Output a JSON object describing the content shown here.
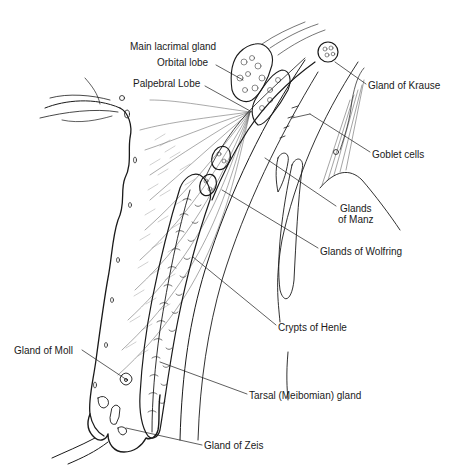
{
  "figure": {
    "colors": {
      "ink": "#1a1a1a",
      "background": "#ffffff"
    }
  },
  "labels": [
    {
      "id": "main-lacrimal-gland",
      "text": "Main lacrimal gland",
      "x": 130,
      "y": 41
    },
    {
      "id": "orbital-lobe",
      "text": "Orbital lobe",
      "x": 157,
      "y": 57
    },
    {
      "id": "palpebral-lobe",
      "text": "Palpebral Lobe",
      "x": 133,
      "y": 78
    },
    {
      "id": "gland-of-krause",
      "text": "Gland of Krause",
      "x": 368,
      "y": 80
    },
    {
      "id": "goblet-cells",
      "text": "Goblet cells",
      "x": 372,
      "y": 149
    },
    {
      "id": "glands-of-manz",
      "text": "Glands\nof Manz",
      "x": 338,
      "y": 203
    },
    {
      "id": "glands-of-wolfring",
      "text": "Glands of Wolfring",
      "x": 320,
      "y": 246
    },
    {
      "id": "crypts-of-henle",
      "text": "Crypts of Henle",
      "x": 278,
      "y": 322
    },
    {
      "id": "gland-of-moll",
      "text": "Gland of Moll",
      "x": 14,
      "y": 345
    },
    {
      "id": "tarsal-gland",
      "text": "Tarsal (Meibomian) gland",
      "x": 249,
      "y": 390
    },
    {
      "id": "gland-of-zeis",
      "text": "Gland of Zeis",
      "x": 204,
      "y": 440
    }
  ],
  "leader_lines": [
    {
      "for": "orbital-lobe",
      "x1": 216,
      "y1": 65,
      "x2": 243,
      "y2": 80
    },
    {
      "for": "palpebral-lobe",
      "x1": 205,
      "y1": 86,
      "x2": 252,
      "y2": 112
    },
    {
      "for": "gland-of-krause",
      "x1": 366,
      "y1": 84,
      "x2": 335,
      "y2": 62
    },
    {
      "for": "goblet-cells",
      "x1": 370,
      "y1": 152,
      "x2": 310,
      "y2": 114
    },
    {
      "for": "goblet-cells-2",
      "x1": 310,
      "y1": 114,
      "x2": 292,
      "y2": 118
    },
    {
      "for": "glands-of-manz",
      "x1": 336,
      "y1": 206,
      "x2": 265,
      "y2": 158
    },
    {
      "for": "glands-of-wolfring",
      "x1": 318,
      "y1": 248,
      "x2": 222,
      "y2": 190
    },
    {
      "for": "crypts-of-henle",
      "x1": 276,
      "y1": 325,
      "x2": 193,
      "y2": 257
    },
    {
      "for": "gland-of-moll",
      "x1": 82,
      "y1": 350,
      "x2": 127,
      "y2": 380
    },
    {
      "for": "tarsal-gland",
      "x1": 247,
      "y1": 394,
      "x2": 160,
      "y2": 362
    },
    {
      "for": "gland-of-zeis",
      "x1": 202,
      "y1": 445,
      "x2": 126,
      "y2": 428
    }
  ]
}
